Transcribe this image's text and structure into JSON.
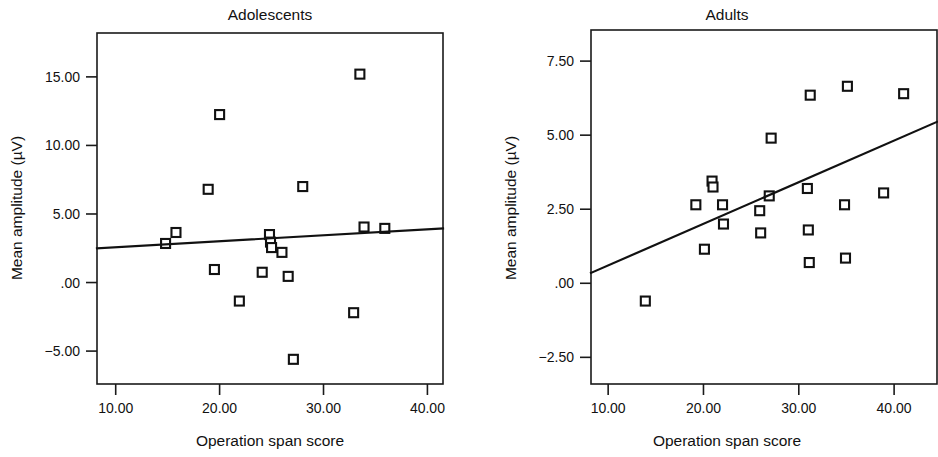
{
  "figure": {
    "background": "#ffffff",
    "ink_color": "#111111",
    "marker_style": "open-square"
  },
  "chart_data": [
    {
      "type": "scatter",
      "title": "Adolescents",
      "xlabel": "Operation span score",
      "ylabel": "Mean amplitude (µV)",
      "xlim": [
        8.2,
        41.5
      ],
      "ylim": [
        -7.4,
        18.2
      ],
      "xticks": [
        10.0,
        20.0,
        30.0,
        40.0
      ],
      "xticklabels": [
        "10.00",
        "20.00",
        "30.00",
        "40.00"
      ],
      "yticks": [
        15.0,
        10.0,
        5.0,
        0.0,
        -5.0
      ],
      "yticklabels": [
        "15.00",
        "10.00",
        "5.00",
        ".00",
        "−5.00"
      ],
      "grid": false,
      "legend": null,
      "x": [
        14.8,
        15.8,
        18.9,
        19.5,
        20.0,
        21.9,
        24.1,
        24.8,
        24.9,
        25.0,
        26.0,
        26.6,
        27.1,
        28.0,
        32.9,
        33.5,
        33.9,
        35.9
      ],
      "y": [
        2.85,
        3.65,
        6.8,
        0.95,
        12.25,
        -1.35,
        0.75,
        3.5,
        2.95,
        2.55,
        2.2,
        0.45,
        -5.6,
        7.0,
        -2.2,
        15.2,
        4.05,
        3.95
      ],
      "trendline": {
        "x_start": 8.2,
        "y_start": 2.5,
        "x_end": 41.5,
        "y_end": 3.95
      }
    },
    {
      "type": "scatter",
      "title": "Adults",
      "xlabel": "Operation span score",
      "ylabel": "Mean amplitude (µV)",
      "xlim": [
        8.2,
        44.5
      ],
      "ylim": [
        -3.4,
        8.55
      ],
      "xticks": [
        10.0,
        20.0,
        30.0,
        40.0
      ],
      "xticklabels": [
        "10.00",
        "20.00",
        "30.00",
        "40.00"
      ],
      "yticks": [
        7.5,
        5.0,
        2.5,
        0.0,
        -2.5
      ],
      "yticklabels": [
        "7.50",
        "5.00",
        "2.50",
        ".00",
        "−2.50"
      ],
      "grid": false,
      "legend": null,
      "x": [
        13.9,
        19.2,
        20.1,
        20.9,
        21.0,
        22.0,
        22.1,
        25.9,
        26.0,
        26.9,
        27.1,
        30.9,
        31.0,
        31.1,
        31.2,
        34.8,
        34.9,
        35.1,
        38.9,
        41.0
      ],
      "y": [
        -0.6,
        2.65,
        1.15,
        3.45,
        3.25,
        2.65,
        2.0,
        2.45,
        1.7,
        2.95,
        4.9,
        3.2,
        1.8,
        0.7,
        6.35,
        2.65,
        0.85,
        6.65,
        3.05,
        6.4
      ],
      "trendline": {
        "x_start": 8.2,
        "y_start": 0.35,
        "x_end": 44.5,
        "y_end": 5.45
      }
    }
  ]
}
